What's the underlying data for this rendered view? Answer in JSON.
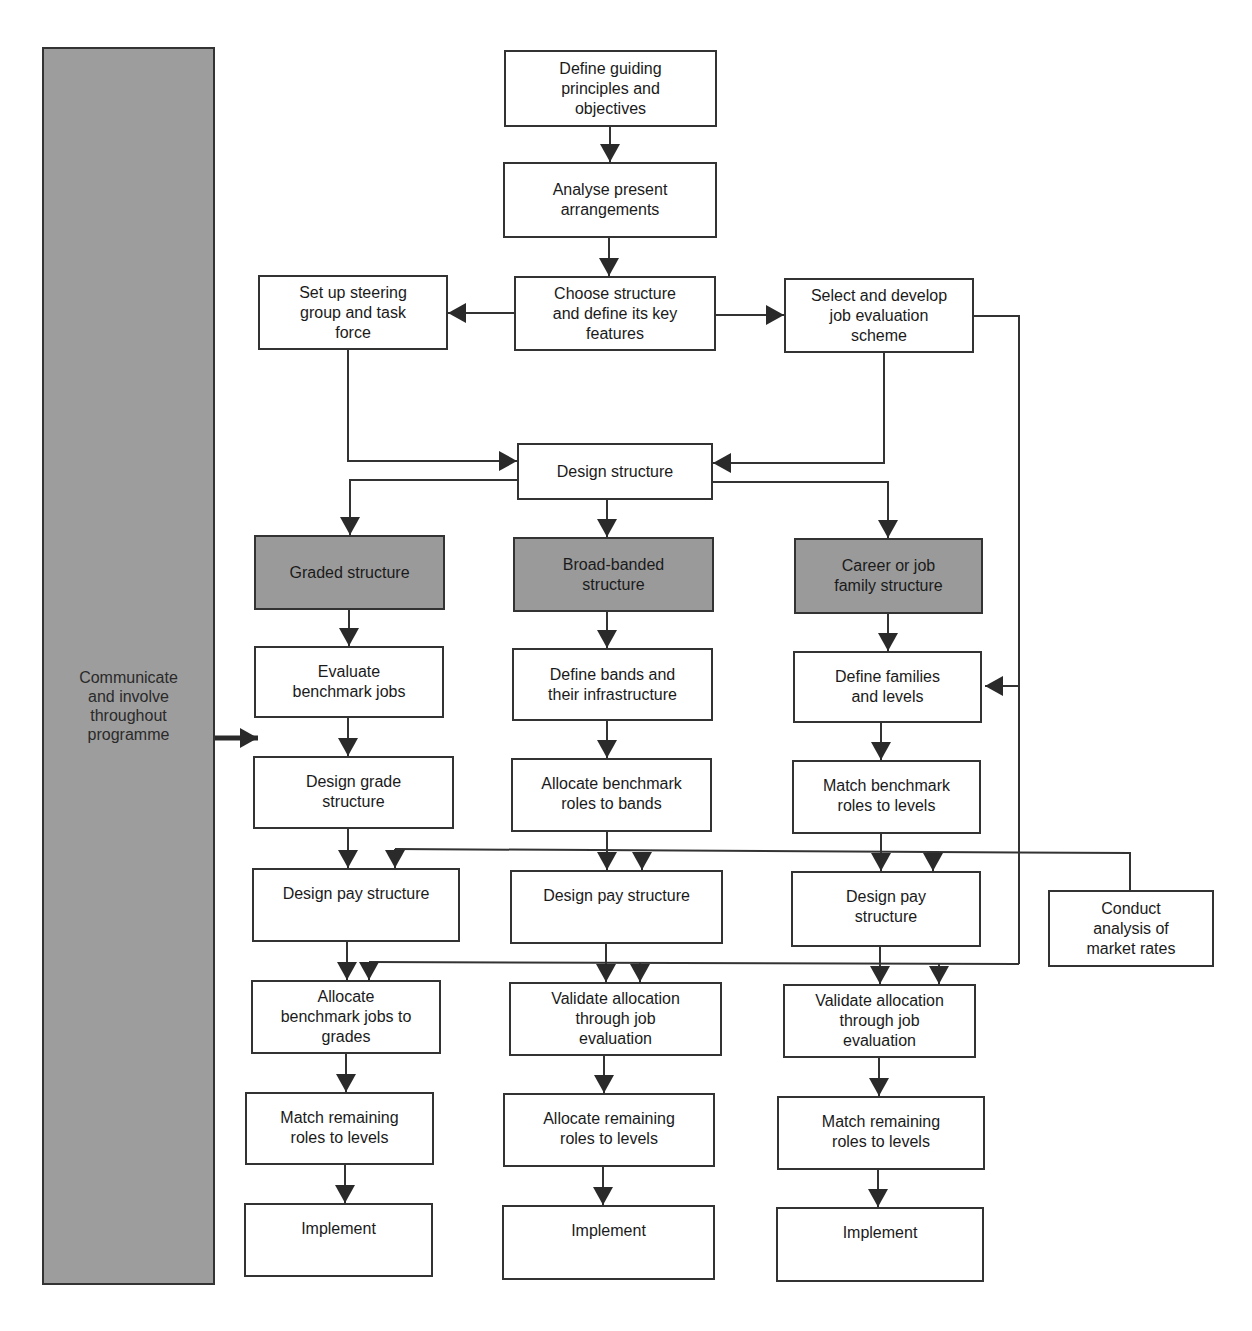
{
  "diagram": {
    "colors": {
      "line": "#333333",
      "box_fill": "#ffffff",
      "shaded_fill": "#9a9a9a",
      "sidebar_fill": "#9d9d9d"
    },
    "sidebar": {
      "label": "Communicate\nand involve\nthroughout\nprogramme"
    },
    "top_flow": {
      "define_principles": "Define guiding\nprinciples and\nobjectives",
      "analyse_present": "Analyse present\narrangements",
      "choose_structure": "Choose structure\nand define its key\nfeatures",
      "steering_group": "Set up steering\ngroup and task\nforce",
      "job_evaluation_scheme": "Select and develop\njob evaluation\nscheme",
      "design_structure": "Design structure"
    },
    "columns": [
      {
        "header": "Graded structure",
        "steps": [
          "Evaluate\nbenchmark jobs",
          "Design grade\nstructure",
          "Design pay structure",
          "Allocate\nbenchmark jobs to\ngrades",
          "Match remaining\nroles to levels",
          "Implement"
        ]
      },
      {
        "header": "Broad-banded\nstructure",
        "steps": [
          "Define bands and\ntheir infrastructure",
          "Allocate benchmark\nroles to bands",
          "Design pay structure",
          "Validate allocation\nthrough job\nevaluation",
          "Allocate remaining\nroles to levels",
          "Implement"
        ]
      },
      {
        "header": "Career or job\nfamily structure",
        "steps": [
          "Define families\nand levels",
          "Match benchmark\nroles to levels",
          "Design pay\nstructure",
          "Validate allocation\nthrough job\nevaluation",
          "Match remaining\nroles to levels",
          "Implement"
        ]
      }
    ],
    "market_rates": "Conduct\nanalysis of\nmarket rates"
  }
}
